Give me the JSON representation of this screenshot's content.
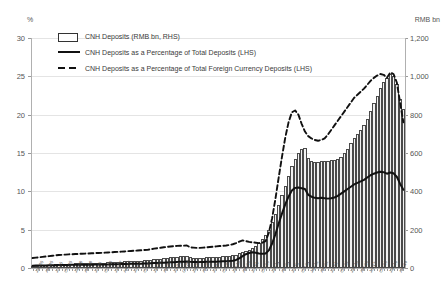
{
  "axes": {
    "left_unit": "%",
    "right_unit": "RMB bn",
    "left_ticks": [
      "0",
      "5",
      "10",
      "15",
      "20",
      "25",
      "30"
    ],
    "right_ticks": [
      "0",
      "200",
      "400",
      "600",
      "800",
      "1,000",
      "1,200"
    ]
  },
  "legend": {
    "items": [
      {
        "key": "bar",
        "label": "CNH Deposits (RMB bn, RHS)"
      },
      {
        "key": "solid",
        "label": "CNH Deposits as a Percentage of Total Deposits (LHS)"
      },
      {
        "key": "dash",
        "label": "CNH Deposits as a Percentage of Total Foreign Currency Deposits (LHS)"
      }
    ]
  },
  "chart_data": {
    "type": "bar",
    "title": "",
    "xlabel": "",
    "ylabel": "%",
    "ylabel_right": "RMB bn",
    "ylim": [
      0,
      30
    ],
    "ylim_right": [
      0,
      1200
    ],
    "grid": true,
    "legend_position": "top-left",
    "categories": [
      "Jan-05",
      "Feb-05",
      "Mar-05",
      "Apr-05",
      "May-05",
      "Jun-05",
      "Jul-05",
      "Aug-05",
      "Sep-05",
      "Oct-05",
      "Nov-05",
      "Dec-05",
      "Jan-06",
      "Feb-06",
      "Mar-06",
      "Apr-06",
      "May-06",
      "Jun-06",
      "Jul-06",
      "Aug-06",
      "Sep-06",
      "Oct-06",
      "Nov-06",
      "Dec-06",
      "Jan-07",
      "Feb-07",
      "Mar-07",
      "Apr-07",
      "May-07",
      "Jun-07",
      "Jul-07",
      "Aug-07",
      "Sep-07",
      "Oct-07",
      "Nov-07",
      "Dec-07",
      "Jan-08",
      "Feb-08",
      "Mar-08",
      "Apr-08",
      "May-08",
      "Jun-08",
      "Jul-08",
      "Aug-08",
      "Sep-08",
      "Oct-08",
      "Nov-08",
      "Dec-08",
      "Jan-09",
      "Feb-09",
      "Mar-09",
      "Apr-09",
      "May-09",
      "Jun-09",
      "Jul-09",
      "Aug-09",
      "Sep-09",
      "Oct-09",
      "Nov-09",
      "Dec-09",
      "Jan-10",
      "Feb-10",
      "Mar-10",
      "Apr-10",
      "May-10",
      "Jun-10",
      "Jul-10",
      "Aug-10",
      "Sep-10",
      "Oct-10",
      "Nov-10",
      "Dec-10",
      "Jan-11",
      "Feb-11",
      "Mar-11",
      "Apr-11",
      "May-11",
      "Jun-11",
      "Jul-11",
      "Aug-11",
      "Sep-11",
      "Oct-11",
      "Nov-11",
      "Dec-11",
      "Jan-12",
      "Feb-12",
      "Mar-12",
      "Apr-12",
      "May-12",
      "Jun-12",
      "Jul-12",
      "Aug-12",
      "Sep-12",
      "Oct-12",
      "Nov-12",
      "Dec-12",
      "Jan-13",
      "Feb-13",
      "Mar-13",
      "Apr-13",
      "May-13",
      "Jun-13",
      "Jul-13",
      "Aug-13",
      "Sep-13",
      "Oct-13",
      "Nov-13",
      "Dec-13",
      "Jan-14",
      "Feb-14",
      "Mar-14",
      "Apr-14",
      "May-14",
      "Jun-14"
    ],
    "series": [
      {
        "name": "CNH Deposits (RMB bn, RHS)",
        "axis": "right",
        "type": "bar",
        "values": [
          12,
          13,
          14,
          15,
          16,
          17,
          18,
          19,
          20,
          21,
          22,
          22,
          23,
          24,
          24,
          25,
          25,
          26,
          26,
          27,
          27,
          28,
          28,
          29,
          30,
          31,
          32,
          33,
          34,
          35,
          36,
          37,
          38,
          39,
          40,
          41,
          43,
          45,
          47,
          49,
          51,
          53,
          55,
          57,
          59,
          61,
          63,
          65,
          55,
          54,
          53,
          53,
          54,
          55,
          56,
          57,
          58,
          60,
          62,
          63,
          64,
          66,
          70,
          76,
          84,
          90,
          95,
          103,
          115,
          130,
          150,
          170,
          200,
          240,
          280,
          330,
          380,
          430,
          480,
          530,
          570,
          600,
          620,
          628,
          575,
          560,
          552,
          554,
          558,
          558,
          560,
          562,
          565,
          570,
          580,
          600,
          620,
          650,
          680,
          700,
          720,
          745,
          780,
          820,
          860,
          900,
          940,
          970,
          990,
          1010,
          1000,
          960,
          880,
          830
        ]
      },
      {
        "name": "CNH Deposits as a Percentage of Total Deposits (LHS)",
        "axis": "left",
        "type": "line",
        "style": "solid",
        "values": [
          0.3,
          0.31,
          0.32,
          0.33,
          0.34,
          0.35,
          0.36,
          0.37,
          0.38,
          0.39,
          0.4,
          0.4,
          0.41,
          0.42,
          0.42,
          0.43,
          0.43,
          0.44,
          0.44,
          0.45,
          0.45,
          0.46,
          0.46,
          0.47,
          0.48,
          0.49,
          0.5,
          0.51,
          0.52,
          0.53,
          0.54,
          0.55,
          0.56,
          0.57,
          0.58,
          0.59,
          0.62,
          0.64,
          0.66,
          0.68,
          0.7,
          0.72,
          0.74,
          0.76,
          0.78,
          0.8,
          0.82,
          0.84,
          0.8,
          0.79,
          0.78,
          0.78,
          0.79,
          0.8,
          0.81,
          0.82,
          0.83,
          0.85,
          0.87,
          0.88,
          0.9,
          0.95,
          1.05,
          1.25,
          1.55,
          1.8,
          1.95,
          2.05,
          2.0,
          1.9,
          1.85,
          1.9,
          2.3,
          3.2,
          4.4,
          5.8,
          7.1,
          8.3,
          9.3,
          10.1,
          10.45,
          10.5,
          10.4,
          10.3,
          9.55,
          9.3,
          9.15,
          9.1,
          9.15,
          9.1,
          9.05,
          9.1,
          9.2,
          9.4,
          9.7,
          10.0,
          10.3,
          10.6,
          10.9,
          11.1,
          11.3,
          11.5,
          11.8,
          12.1,
          12.3,
          12.45,
          12.55,
          12.5,
          12.3,
          12.45,
          12.35,
          11.9,
          11.0,
          10.2
        ]
      },
      {
        "name": "CNH Deposits as a Percentage of Total Foreign Currency Deposits (LHS)",
        "axis": "left",
        "type": "line",
        "style": "dashed",
        "values": [
          1.3,
          1.35,
          1.4,
          1.45,
          1.5,
          1.55,
          1.6,
          1.65,
          1.7,
          1.72,
          1.75,
          1.78,
          1.8,
          1.82,
          1.84,
          1.86,
          1.88,
          1.9,
          1.92,
          1.94,
          1.96,
          1.98,
          2.0,
          2.02,
          2.05,
          2.08,
          2.1,
          2.13,
          2.16,
          2.19,
          2.22,
          2.25,
          2.28,
          2.31,
          2.34,
          2.37,
          2.45,
          2.52,
          2.58,
          2.64,
          2.7,
          2.76,
          2.8,
          2.85,
          2.88,
          2.9,
          2.92,
          2.94,
          2.7,
          2.66,
          2.62,
          2.62,
          2.66,
          2.7,
          2.74,
          2.78,
          2.82,
          2.86,
          2.9,
          2.94,
          3.0,
          3.1,
          3.25,
          3.45,
          3.6,
          3.5,
          3.4,
          3.35,
          3.3,
          3.25,
          3.3,
          3.5,
          4.6,
          6.5,
          9.0,
          11.8,
          14.5,
          17.0,
          19.0,
          20.3,
          20.55,
          20.0,
          18.8,
          17.8,
          17.2,
          16.9,
          16.7,
          16.6,
          16.7,
          16.9,
          17.4,
          18.0,
          18.6,
          19.2,
          19.8,
          20.4,
          21.0,
          21.6,
          22.2,
          22.6,
          23.0,
          23.4,
          23.9,
          24.4,
          24.8,
          25.1,
          25.3,
          25.2,
          24.8,
          25.5,
          25.3,
          24.2,
          21.6,
          19.0
        ]
      }
    ]
  }
}
